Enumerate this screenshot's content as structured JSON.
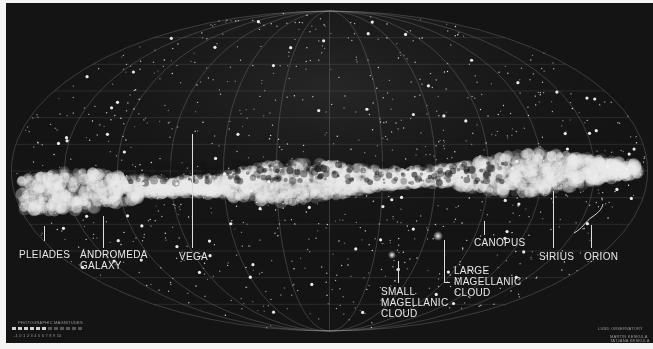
{
  "image": {
    "subject": "All-sky panorama of the Milky Way",
    "colors": {
      "background": "#151515",
      "label": "#e8e8e8",
      "border": "#f4f4f2"
    }
  },
  "labels": [
    {
      "id": "pleiades",
      "text": "PLEIADES"
    },
    {
      "id": "andromeda",
      "text": "ANDROMEDA\nGALAXY"
    },
    {
      "id": "vega",
      "text": "VEGA"
    },
    {
      "id": "small-magellanic",
      "text": "SMALL\nMAGELLANIC\nCLOUD"
    },
    {
      "id": "large-magellanic",
      "text": "LARGE\nMAGELLANIC\nCLOUD"
    },
    {
      "id": "canopus",
      "text": "CANOPUS"
    },
    {
      "id": "sirius",
      "text": "SIRIUS"
    },
    {
      "id": "orion",
      "text": "ORION"
    }
  ],
  "legend": {
    "title": "PHOTOGRAPHIC MAGNITUDES",
    "scale": "-1 0 1 2 3 4 5 6 7 8 9 10"
  },
  "credit": {
    "observatory": "LUND OBSERVATORY",
    "authors_line1": "MARTIN KESKULA",
    "authors_line2": "TATJANA KESKULA"
  }
}
